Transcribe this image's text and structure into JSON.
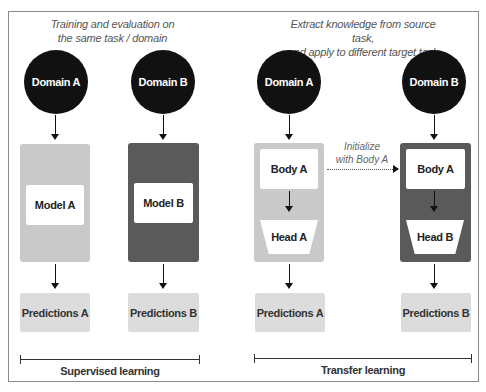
{
  "left_section": {
    "caption_line1": "Training and evaluation on",
    "caption_line2": "the same task / domain",
    "columns": [
      {
        "domain": "Domain A",
        "model": "Model A",
        "predictions": "Predictions A",
        "shade": "light"
      },
      {
        "domain": "Domain B",
        "model": "Model B",
        "predictions": "Predictions B",
        "shade": "dark"
      }
    ],
    "bracket_label": "Supervised learning"
  },
  "right_section": {
    "caption_line1": "Extract knowledge from source task,",
    "caption_line2": "and apply to  different target task",
    "columns": [
      {
        "domain": "Domain A",
        "body": "Body A",
        "head": "Head A",
        "predictions": "Predictions A",
        "shade": "light"
      },
      {
        "domain": "Domain B",
        "body": "Body A",
        "head": "Head B",
        "predictions": "Predictions B",
        "shade": "dark"
      }
    ],
    "transfer_label_line1": "Initialize",
    "transfer_label_line2": "with Body A",
    "bracket_label": "Transfer learning"
  },
  "colors": {
    "circle": "#111111",
    "light_panel": "#c9c9c9",
    "dark_panel": "#5a5a5a",
    "predictions_box": "#dcdcdc",
    "frame_border": "#8a8a8a"
  }
}
